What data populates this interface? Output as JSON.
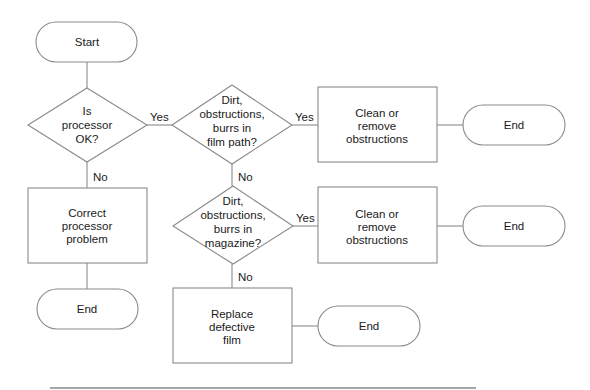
{
  "diagram": {
    "type": "flowchart",
    "colors": {
      "stroke": "#8a8a8a",
      "text": "#1a1a1a",
      "background": "#ffffff"
    },
    "nodes": {
      "start": {
        "shape": "terminator",
        "lines": [
          "Start"
        ]
      },
      "q_processor": {
        "shape": "decision",
        "lines": [
          "Is",
          "processor",
          "OK?"
        ]
      },
      "q_filmpath": {
        "shape": "decision",
        "lines": [
          "Dirt,",
          "obstructions,",
          "burrs in",
          "film path?"
        ]
      },
      "clean1": {
        "shape": "process",
        "lines": [
          "Clean or",
          "remove",
          "obstructions"
        ]
      },
      "end1": {
        "shape": "terminator",
        "lines": [
          "End"
        ]
      },
      "correct": {
        "shape": "process",
        "lines": [
          "Correct",
          "processor",
          "problem"
        ]
      },
      "end_left": {
        "shape": "terminator",
        "lines": [
          "End"
        ]
      },
      "q_magazine": {
        "shape": "decision",
        "lines": [
          "Dirt,",
          "obstructions,",
          "burrs in",
          "magazine?"
        ]
      },
      "clean2": {
        "shape": "process",
        "lines": [
          "Clean or",
          "remove",
          "obstructions"
        ]
      },
      "end2": {
        "shape": "terminator",
        "lines": [
          "End"
        ]
      },
      "replace": {
        "shape": "process",
        "lines": [
          "Replace",
          "defective",
          "film"
        ]
      },
      "end3": {
        "shape": "terminator",
        "lines": [
          "End"
        ]
      }
    },
    "edges": {
      "e1": {
        "from": "start",
        "to": "q_processor",
        "label": ""
      },
      "e2": {
        "from": "q_processor",
        "to": "q_filmpath",
        "label": "Yes"
      },
      "e3": {
        "from": "q_processor",
        "to": "correct",
        "label": "No"
      },
      "e4": {
        "from": "q_filmpath",
        "to": "clean1",
        "label": "Yes"
      },
      "e5": {
        "from": "clean1",
        "to": "end1",
        "label": ""
      },
      "e6": {
        "from": "q_filmpath",
        "to": "q_magazine",
        "label": "No"
      },
      "e7": {
        "from": "correct",
        "to": "end_left",
        "label": ""
      },
      "e8": {
        "from": "q_magazine",
        "to": "clean2",
        "label": "Yes"
      },
      "e9": {
        "from": "clean2",
        "to": "end2",
        "label": ""
      },
      "e10": {
        "from": "q_magazine",
        "to": "replace",
        "label": "No"
      },
      "e11": {
        "from": "replace",
        "to": "end3",
        "label": ""
      }
    }
  }
}
